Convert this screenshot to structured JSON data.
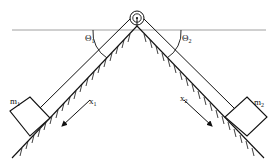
{
  "diagram": {
    "type": "physics-two-inclines-pulley",
    "labels": {
      "theta1": "Θ",
      "theta1_sub": "1",
      "theta2": "Θ",
      "theta2_sub": "2",
      "mass1": "m",
      "mass1_sub": "1",
      "mass2": "m",
      "mass2_sub": "2",
      "x1": "x",
      "x1_sub": "1",
      "x2": "x",
      "x2_sub": "2"
    },
    "colors": {
      "line": "#111111",
      "horizontal": "#888888",
      "background": "#ffffff"
    }
  }
}
